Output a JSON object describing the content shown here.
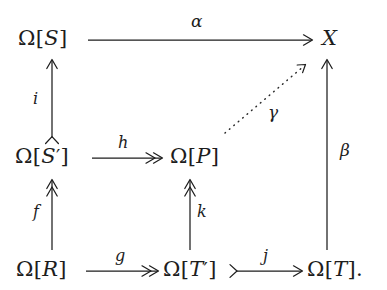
{
  "diagram": {
    "background_color": "#ffffff",
    "ink_color": "#1d1d1d",
    "nodes": [
      {
        "id": "n_S",
        "label": "Ω[S]",
        "omega": "Ω",
        "inner": "S",
        "prime": "",
        "period": ""
      },
      {
        "id": "n_X",
        "label": "X",
        "omega": "",
        "inner": "X",
        "prime": "",
        "period": ""
      },
      {
        "id": "n_Sprime",
        "label": "Ω[S′]",
        "omega": "Ω",
        "inner": "S",
        "prime": "′",
        "period": ""
      },
      {
        "id": "n_P",
        "label": "Ω[P]",
        "omega": "Ω",
        "inner": "P",
        "prime": "",
        "period": ""
      },
      {
        "id": "n_R",
        "label": "Ω[R]",
        "omega": "Ω",
        "inner": "R",
        "prime": "",
        "period": ""
      },
      {
        "id": "n_Tprime",
        "label": "Ω[T′]",
        "omega": "Ω",
        "inner": "T",
        "prime": "′",
        "period": ""
      },
      {
        "id": "n_T",
        "label": "Ω[T].",
        "omega": "Ω",
        "inner": "T",
        "prime": "",
        "period": "."
      }
    ],
    "morphisms": [
      {
        "id": "m_alpha",
        "label": "α",
        "from": "Ω[S]",
        "to": "X",
        "kind": "plain",
        "style": "solid",
        "direction": "right"
      },
      {
        "id": "m_i",
        "label": "i",
        "from": "Ω[S′]",
        "to": "Ω[S]",
        "kind": "mono",
        "style": "solid",
        "direction": "up"
      },
      {
        "id": "m_h",
        "label": "h",
        "from": "Ω[S′]",
        "to": "Ω[P]",
        "kind": "epi",
        "style": "solid",
        "direction": "right"
      },
      {
        "id": "m_gamma",
        "label": "γ",
        "from": "Ω[P]",
        "to": "X",
        "kind": "plain",
        "style": "dotted",
        "direction": "up-right"
      },
      {
        "id": "m_beta",
        "label": "β",
        "from": "Ω[T].",
        "to": "X",
        "kind": "plain",
        "style": "solid",
        "direction": "up"
      },
      {
        "id": "m_f",
        "label": "f",
        "from": "Ω[R]",
        "to": "Ω[S′]",
        "kind": "epi",
        "style": "solid",
        "direction": "up"
      },
      {
        "id": "m_k",
        "label": "k",
        "from": "Ω[T′]",
        "to": "Ω[P]",
        "kind": "epi",
        "style": "solid",
        "direction": "up"
      },
      {
        "id": "m_g",
        "label": "g",
        "from": "Ω[R]",
        "to": "Ω[T′]",
        "kind": "epi",
        "style": "solid",
        "direction": "right"
      },
      {
        "id": "m_j",
        "label": "j",
        "from": "Ω[T′]",
        "to": "Ω[T].",
        "kind": "mono",
        "style": "solid",
        "direction": "right"
      }
    ]
  }
}
